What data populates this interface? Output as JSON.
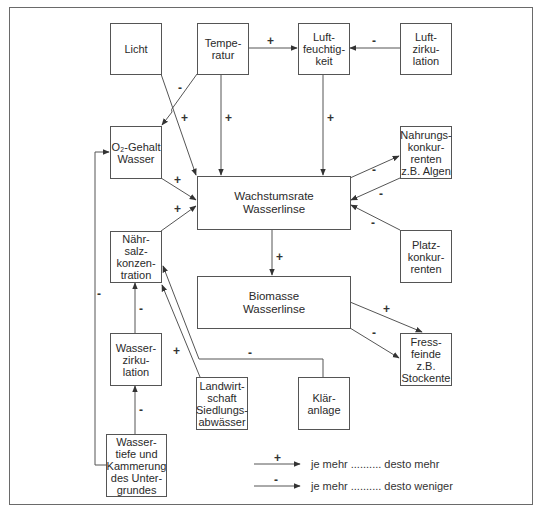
{
  "diagram": {
    "nodes": {
      "licht": {
        "label": "Licht"
      },
      "temperatur": {
        "label": "Tempe-\nratur"
      },
      "luftfeuchtigkeit": {
        "label": "Luft-\nfeuchtig-\nkeit"
      },
      "luftzirkulation": {
        "label": "Luft-\nzirku-\nlation"
      },
      "o2_gehalt": {
        "label": "O₂-Gehalt\nWasser"
      },
      "wachstumsrate": {
        "label": "Wachstumsrate\nWasserlinse"
      },
      "nahrungskonkurrenten": {
        "label": "Nahrungs-\nkonkur-\nrenten\nz.B. Algen"
      },
      "naehrsalz": {
        "label": "Nähr-\nsalz-\nkonzen-\ntration"
      },
      "platzkonkurrenten": {
        "label": "Platz-\nkonkur-\nrenten"
      },
      "biomasse": {
        "label": "Biomasse\nWasserlinse"
      },
      "fressfeinde": {
        "label": "Fress-\nfeinde\nz.B.\nStockente"
      },
      "wasserzirkulation": {
        "label": "Wasser-\nzirku-\nlation"
      },
      "landwirtschaft": {
        "label": "Landwirt-\nschaft\nSiedlungs-\nabwässer"
      },
      "klaeranlage": {
        "label": "Klär-\nanlage"
      },
      "wassertiefe": {
        "label": "Wasser-\ntiefe und\nKammerung\ndes Unter-\ngrundes"
      }
    },
    "edges": [
      {
        "from": "Temperatur",
        "to": "Luftfeuchtigkeit",
        "sign": "+"
      },
      {
        "from": "Luftzirkulation",
        "to": "Luftfeuchtigkeit",
        "sign": "-"
      },
      {
        "from": "Temperatur",
        "to": "O2-Gehalt Wasser",
        "sign": "-"
      },
      {
        "from": "Licht",
        "to": "Wachstumsrate Wasserlinse",
        "sign": "+"
      },
      {
        "from": "Temperatur",
        "to": "Wachstumsrate Wasserlinse",
        "sign": "+"
      },
      {
        "from": "Luftfeuchtigkeit",
        "to": "Wachstumsrate Wasserlinse",
        "sign": "+"
      },
      {
        "from": "O2-Gehalt Wasser",
        "to": "Wachstumsrate Wasserlinse",
        "sign": "+"
      },
      {
        "from": "Nährsalzkonzentration",
        "to": "Wachstumsrate Wasserlinse",
        "sign": "+"
      },
      {
        "from": "Wachstumsrate Wasserlinse",
        "to": "Nahrungskonkurrenten",
        "sign": "-"
      },
      {
        "from": "Nahrungskonkurrenten",
        "to": "Wachstumsrate Wasserlinse",
        "sign": "-"
      },
      {
        "from": "Platzkonkurrenten",
        "to": "Wachstumsrate Wasserlinse",
        "sign": "-"
      },
      {
        "from": "Wachstumsrate Wasserlinse",
        "to": "Biomasse Wasserlinse",
        "sign": "+"
      },
      {
        "from": "Biomasse Wasserlinse",
        "to": "Fressfeinde",
        "sign": "+"
      },
      {
        "from": "Biomasse Wasserlinse",
        "to": "Fressfeinde",
        "sign": "-"
      },
      {
        "from": "Wasserzirkulation",
        "to": "Nährsalzkonzentration",
        "sign": "-"
      },
      {
        "from": "Landwirtschaft Siedlungsabwässer",
        "to": "Nährsalzkonzentration",
        "sign": "+"
      },
      {
        "from": "Kläranlage",
        "to": "Nährsalzkonzentration",
        "sign": "-"
      },
      {
        "from": "Wassertiefe und Kammerung des Untergrundes",
        "to": "Wasserzirkulation",
        "sign": "-"
      },
      {
        "from": "Wassertiefe und Kammerung des Untergrundes",
        "to": "O2-Gehalt Wasser",
        "sign": "-"
      }
    ],
    "signs": {
      "plus": "+",
      "minus": "-"
    },
    "legend": {
      "positive": {
        "sign": "+",
        "text": "je mehr .......... desto mehr"
      },
      "negative": {
        "sign": "-",
        "text": "je mehr .......... desto weniger"
      }
    },
    "colors": {
      "line": "#555555",
      "frame": "#6a6a6a",
      "text": "#2a2a2a",
      "background": "#ffffff"
    }
  }
}
